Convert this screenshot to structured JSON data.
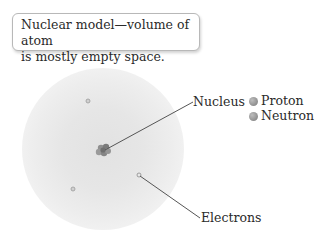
{
  "caption": {
    "line1": "Nuclear model—volume of atom",
    "line2": "is mostly empty space."
  },
  "labels": {
    "nucleus": "Nucleus",
    "electrons": "Electrons"
  },
  "legend": {
    "items": [
      {
        "label": "Proton",
        "color": "#8a8a8a"
      },
      {
        "label": "Neutron",
        "color": "#8a8a8a"
      }
    ]
  }
}
